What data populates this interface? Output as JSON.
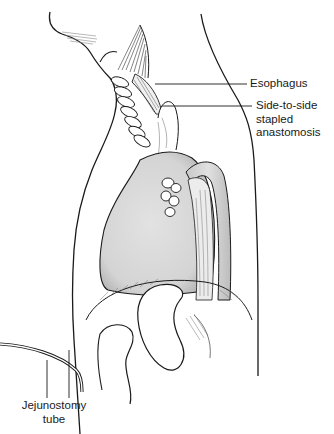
{
  "figure": {
    "type": "anatomical illustration"
  },
  "labels": {
    "esophagus": "Esophagus",
    "anastomosis": {
      "line1": "Side-to-side",
      "line2": "stapled",
      "line3": "anastomosis"
    },
    "jejunostomy": {
      "line1": "Jejunostomy",
      "line2": "tube"
    }
  },
  "colors": {
    "ink": "#1a1a1a",
    "organ_fill": "#d9d9d9",
    "organ_shade": "#bfbfbf",
    "background": "#ffffff"
  }
}
